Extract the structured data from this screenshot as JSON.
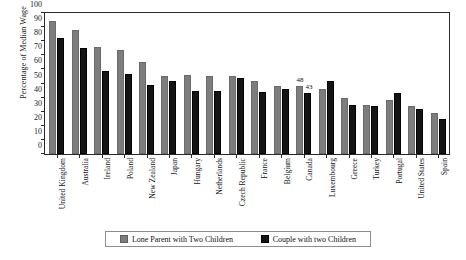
{
  "chart_data": {
    "type": "bar",
    "title": "",
    "xlabel": "",
    "ylabel": "Percentage of Median Wage",
    "ylim": [
      0,
      100
    ],
    "yticks": [
      0,
      10,
      20,
      30,
      40,
      50,
      60,
      70,
      80,
      90,
      100
    ],
    "grid": false,
    "legend_position": "bottom",
    "categories": [
      "United Kingdom",
      "Australia",
      "Ireland",
      "Poland",
      "New Zealand",
      "Japan",
      "Hungary",
      "Netherlands",
      "Czech Republic",
      "France",
      "Belgium",
      "Canada",
      "Luxembourg",
      "Greece",
      "Turkey",
      "Portugal",
      "United States",
      "Spain"
    ],
    "series": [
      {
        "name": "Lone Parent with Two Children",
        "color": "#7d7d7d",
        "values": [
          94,
          88,
          76,
          74,
          65,
          55,
          56,
          55,
          55,
          52,
          48,
          48,
          46,
          40,
          35,
          38,
          34,
          29
        ],
        "data_labels": [
          "",
          "",
          "",
          "",
          "",
          "",
          "",
          "",
          "",
          "",
          "",
          "48",
          "",
          "",
          "",
          "",
          "",
          ""
        ]
      },
      {
        "name": "Couple with two Children",
        "color": "#141414",
        "values": [
          82,
          75,
          59,
          57,
          49,
          52,
          45,
          45,
          54,
          44,
          46,
          43,
          52,
          35,
          34,
          43,
          32,
          25
        ],
        "data_labels": [
          "",
          "",
          "",
          "",
          "",
          "",
          "",
          "",
          "",
          "",
          "",
          "43",
          "",
          "",
          "",
          "",
          "",
          ""
        ]
      }
    ]
  },
  "legend": {
    "entries": [
      {
        "label": "Lone Parent with Two Children",
        "swatch": "lone"
      },
      {
        "label": "Couple with two Children",
        "swatch": "couple"
      }
    ]
  }
}
